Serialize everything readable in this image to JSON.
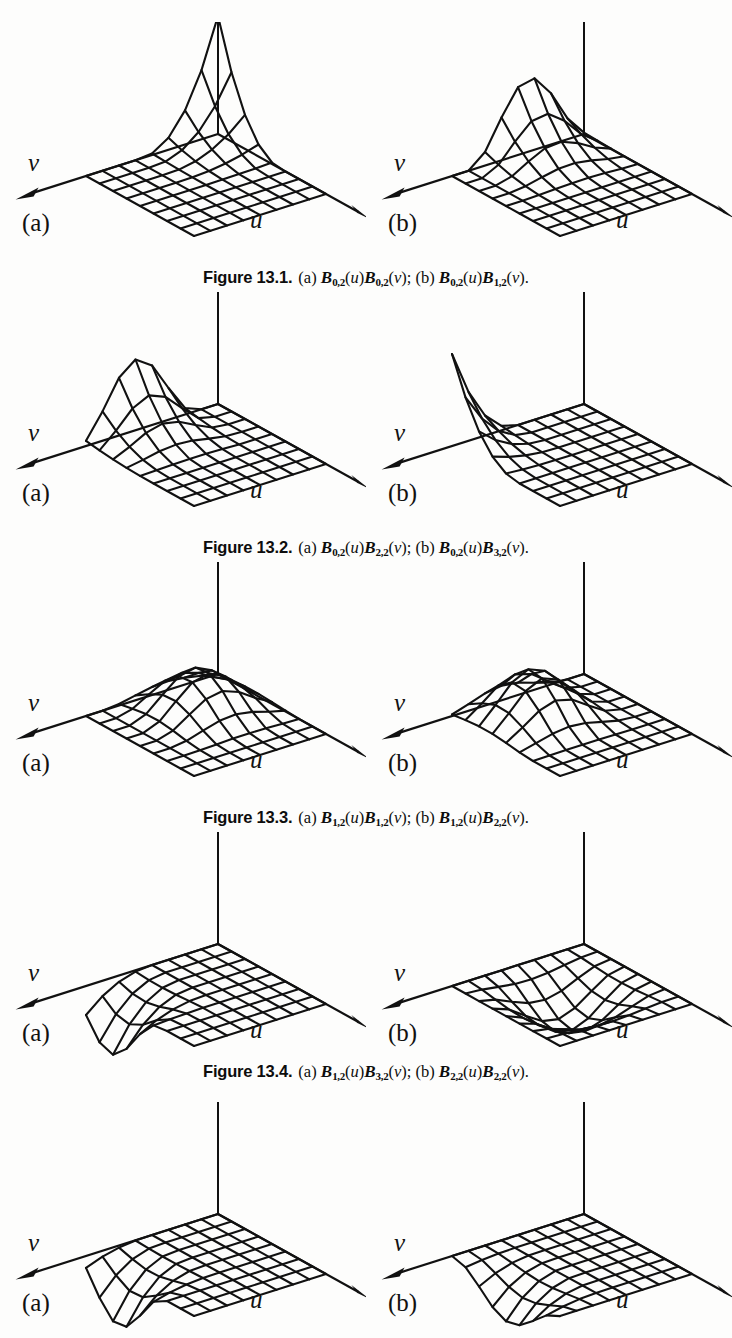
{
  "page": {
    "width": 732,
    "height": 1338,
    "background": "#fdfdfc",
    "ink": "#111111",
    "kind": "scanned-textbook-page"
  },
  "labels": {
    "axis_v": "v",
    "axis_u": "u",
    "panel_a": "(a)",
    "panel_b": "(b)"
  },
  "figures": [
    {
      "caption_head": "Figure 13.1.",
      "caption_parts": {
        "a_prefix": "(a)",
        "a_first_sub": "0,2",
        "a_first_arg": "u",
        "a_second_sub": "0,2",
        "a_second_arg": "v",
        "separator": ";",
        "b_prefix": "(b)",
        "b_first_sub": "0,2",
        "b_first_arg": "u",
        "b_second_sub": "1,2",
        "b_second_arg": "v",
        "terminator": "."
      },
      "caption_text": "Figure 13.1. (a) B0,2(u)B0,2(v); (b) B0,2(u)B1,2(v).",
      "panels": [
        {
          "tag": "(a)",
          "shape": "corner-spike",
          "peak_u": 0.0,
          "peak_v": 0.0,
          "peak_height": 1.0
        },
        {
          "tag": "(b)",
          "shape": "edge-ridge",
          "peak_u": 0.0,
          "peak_v": 0.42,
          "peak_height": 0.62
        }
      ]
    },
    {
      "caption_head": "Figure 13.2.",
      "caption_parts": {
        "a_prefix": "(a)",
        "a_first_sub": "0,2",
        "a_first_arg": "u",
        "a_second_sub": "2,2",
        "a_second_arg": "v",
        "separator": ";",
        "b_prefix": "(b)",
        "b_first_sub": "0,2",
        "b_first_arg": "u",
        "b_second_sub": "3,2",
        "b_second_arg": "v",
        "terminator": "."
      },
      "caption_text": "Figure 13.2. (a) B0,2(u)B2,2(v); (b) B0,2(u)B3,2(v).",
      "panels": [
        {
          "tag": "(a)",
          "shape": "ridge-midback",
          "peak_u": 0.0,
          "peak_v": 0.62,
          "peak_height": 0.6
        },
        {
          "tag": "(b)",
          "shape": "far-edge-ridge",
          "peak_u": 0.0,
          "peak_v": 1.0,
          "peak_height": 0.78
        }
      ]
    },
    {
      "caption_head": "Figure 13.3.",
      "caption_parts": {
        "a_prefix": "(a)",
        "a_first_sub": "1,2",
        "a_first_arg": "u",
        "a_second_sub": "1,2",
        "a_second_arg": "v",
        "separator": ";",
        "b_prefix": "(b)",
        "b_first_sub": "1,2",
        "b_first_arg": "u",
        "b_second_sub": "2,2",
        "b_second_arg": "v",
        "terminator": "."
      },
      "caption_text": "Figure 13.3. (a) B1,2(u)B1,2(v); (b) B1,2(u)B2,2(v).",
      "panels": [
        {
          "tag": "(a)",
          "shape": "interior-bump",
          "peak_u": 0.33,
          "peak_v": 0.4,
          "peak_height": 0.34
        },
        {
          "tag": "(b)",
          "shape": "interior-bump-shifted",
          "peak_u": 0.3,
          "peak_v": 0.62,
          "peak_height": 0.4
        }
      ]
    },
    {
      "caption_head": "Figure 13.4.",
      "caption_parts": {
        "a_prefix": "(a)",
        "a_first_sub": "1,2",
        "a_first_arg": "u",
        "a_second_sub": "3,2",
        "a_second_arg": "v",
        "separator": ";",
        "b_prefix": "(b)",
        "b_first_sub": "2,2",
        "b_first_arg": "u",
        "b_second_sub": "2,2",
        "b_second_arg": "v",
        "terminator": "."
      },
      "caption_text": "Figure 13.4. (a) B1,2(u)B3,2(v); (b) B2,2(u)B2,2(v).",
      "panels": [
        {
          "tag": "(a)",
          "shape": "near-edge-fold",
          "peak_u": 0.22,
          "peak_v": 1.0,
          "peak_height": 0.46
        },
        {
          "tag": "(b)",
          "shape": "center-bump",
          "peak_u": 0.48,
          "peak_v": 0.52,
          "peak_height": 0.3
        }
      ]
    },
    {
      "caption_head": "",
      "caption_parts": null,
      "caption_text": "",
      "panels": [
        {
          "tag": "(a)",
          "shape": "deep-near-fold",
          "peak_u": 0.3,
          "peak_v": 0.92,
          "peak_height": 0.44
        },
        {
          "tag": "(b)",
          "shape": "shallow-near-fold",
          "peak_u": 0.52,
          "peak_v": 0.82,
          "peak_height": 0.3
        }
      ]
    }
  ],
  "chart_data": {
    "type": "surface-grid",
    "grid_cells_u": 8,
    "grid_cells_v": 8,
    "axes": [
      "u",
      "v",
      "z"
    ],
    "xlabel": "u",
    "ylabel": "v",
    "zlabel": "",
    "grid": true,
    "legend": "none",
    "surfaces": [
      {
        "figure": "13.1",
        "panel": "a",
        "fn": "B0,2(u)B0,2(v)",
        "peak_uv": [
          0.0,
          0.0
        ],
        "peak_z": 1.0
      },
      {
        "figure": "13.1",
        "panel": "b",
        "fn": "B0,2(u)B1,2(v)",
        "peak_uv": [
          0.0,
          0.42
        ],
        "peak_z": 0.62
      },
      {
        "figure": "13.2",
        "panel": "a",
        "fn": "B0,2(u)B2,2(v)",
        "peak_uv": [
          0.0,
          0.62
        ],
        "peak_z": 0.6
      },
      {
        "figure": "13.2",
        "panel": "b",
        "fn": "B0,2(u)B3,2(v)",
        "peak_uv": [
          0.0,
          1.0
        ],
        "peak_z": 0.78
      },
      {
        "figure": "13.3",
        "panel": "a",
        "fn": "B1,2(u)B1,2(v)",
        "peak_uv": [
          0.33,
          0.4
        ],
        "peak_z": 0.34
      },
      {
        "figure": "13.3",
        "panel": "b",
        "fn": "B1,2(u)B2,2(v)",
        "peak_uv": [
          0.3,
          0.62
        ],
        "peak_z": 0.4
      },
      {
        "figure": "13.4",
        "panel": "a",
        "fn": "B1,2(u)B3,2(v)",
        "peak_uv": [
          0.22,
          1.0
        ],
        "peak_z": 0.46
      },
      {
        "figure": "13.4",
        "panel": "b",
        "fn": "B2,2(u)B2,2(v)",
        "peak_uv": [
          0.48,
          0.52
        ],
        "peak_z": 0.3
      },
      {
        "figure": "13.5",
        "panel": "a",
        "fn": "",
        "peak_uv": [
          0.3,
          0.92
        ],
        "peak_z": 0.44
      },
      {
        "figure": "13.5",
        "panel": "b",
        "fn": "",
        "peak_uv": [
          0.52,
          0.82
        ],
        "peak_z": 0.3
      }
    ]
  }
}
